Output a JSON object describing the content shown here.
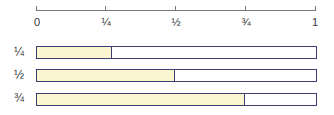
{
  "axis": {
    "ticks": [
      {
        "label": "0",
        "pos": 0
      },
      {
        "label": "¼",
        "pos": 0.25
      },
      {
        "label": "½",
        "pos": 0.5
      },
      {
        "label": "¾",
        "pos": 0.75
      },
      {
        "label": "1",
        "pos": 1
      }
    ]
  },
  "bars": [
    {
      "label": "¼",
      "fill_px": 75
    },
    {
      "label": "½",
      "fill_px": 138
    },
    {
      "label": "¾",
      "fill_px": 208
    }
  ],
  "colors": {
    "fill": "#fbf6cf",
    "outline": "#3c3f70",
    "axis": "#777777"
  }
}
